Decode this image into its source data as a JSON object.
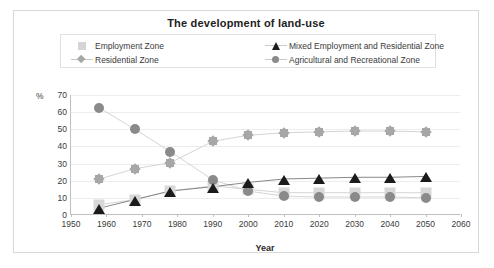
{
  "chart_data": {
    "type": "line",
    "title": "The development of land-use",
    "xlabel": "Year",
    "ylabel": "%",
    "xlim": [
      1950,
      2060
    ],
    "ylim": [
      0,
      70
    ],
    "xticks": [
      1950,
      1960,
      1970,
      1980,
      1990,
      2000,
      2010,
      2020,
      2030,
      2040,
      2050,
      2060
    ],
    "yticks": [
      0,
      10,
      20,
      30,
      40,
      50,
      60,
      70
    ],
    "grid": true,
    "legend_position": "top",
    "x": [
      1958,
      1968,
      1978,
      1990,
      2000,
      2010,
      2020,
      2030,
      2040,
      2050
    ],
    "series": [
      {
        "name": "Employment Zone",
        "marker": "square",
        "color": "#d8d8d8",
        "values": [
          6,
          9,
          14,
          17,
          15,
          13,
          13,
          13,
          13,
          13
        ]
      },
      {
        "name": "Residential Zone",
        "marker": "diamond",
        "color": "#a7a7a7",
        "values": [
          21,
          27,
          30.5,
          43,
          46.5,
          48,
          48.5,
          49,
          49,
          48.5
        ]
      },
      {
        "name": "Mixed Employment and Residential Zone",
        "marker": "triangle",
        "color": "#1b1b1b",
        "values": [
          4,
          9,
          14,
          16.5,
          19,
          21,
          21.5,
          22,
          22,
          22.5
        ]
      },
      {
        "name": "Agricultural and Recreational Zone",
        "marker": "circle",
        "color": "#8a8a8a",
        "values": [
          62.5,
          50,
          37,
          20.5,
          14,
          11,
          10.5,
          10.5,
          10.5,
          10
        ]
      }
    ]
  }
}
